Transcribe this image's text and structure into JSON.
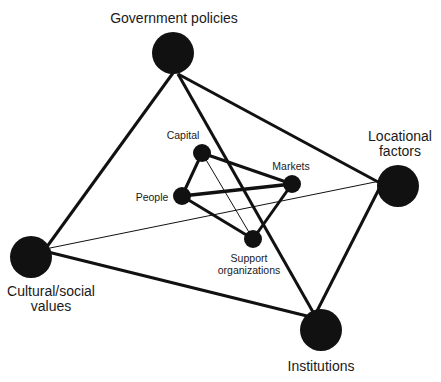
{
  "diagram": {
    "type": "network",
    "colors": {
      "node": "#111111",
      "edge": "#111111",
      "background": "#ffffff",
      "text": "#1a1a1a"
    },
    "outer_nodes": [
      {
        "id": "gov",
        "label_lines": [
          "Government policies"
        ],
        "x": 173,
        "y": 53,
        "r": 21
      },
      {
        "id": "loc",
        "label_lines": [
          "Locational",
          "factors"
        ],
        "x": 398,
        "y": 186,
        "r": 21
      },
      {
        "id": "cul",
        "label_lines": [
          "Cultural/social",
          "values"
        ],
        "x": 31,
        "y": 257,
        "r": 21
      },
      {
        "id": "ins",
        "label_lines": [
          "Institutions"
        ],
        "x": 321,
        "y": 330,
        "r": 21
      }
    ],
    "inner_nodes": [
      {
        "id": "cap",
        "label_lines": [
          "Capital"
        ],
        "x": 202,
        "y": 153,
        "r": 9
      },
      {
        "id": "mkt",
        "label_lines": [
          "Markets"
        ],
        "x": 292,
        "y": 184,
        "r": 9
      },
      {
        "id": "ppl",
        "label_lines": [
          "People"
        ],
        "x": 182,
        "y": 196,
        "r": 9
      },
      {
        "id": "sup",
        "label_lines": [
          "Support",
          "organizations"
        ],
        "x": 253,
        "y": 239,
        "r": 9
      }
    ],
    "edges": [
      {
        "from": "gov",
        "to": "cul",
        "weight": "thick"
      },
      {
        "from": "gov",
        "to": "loc",
        "weight": "thick"
      },
      {
        "from": "gov",
        "to": "ins",
        "weight": "thick"
      },
      {
        "from": "loc",
        "to": "ins",
        "weight": "thick"
      },
      {
        "from": "cul",
        "to": "ins",
        "weight": "thick"
      },
      {
        "from": "cul",
        "to": "loc",
        "weight": "thin"
      },
      {
        "from": "cap",
        "to": "ppl",
        "weight": "thick"
      },
      {
        "from": "cap",
        "to": "mkt",
        "weight": "thick"
      },
      {
        "from": "ppl",
        "to": "mkt",
        "weight": "thick"
      },
      {
        "from": "ppl",
        "to": "sup",
        "weight": "thick"
      },
      {
        "from": "mkt",
        "to": "sup",
        "weight": "thick"
      },
      {
        "from": "cap",
        "to": "sup",
        "weight": "thin"
      }
    ],
    "labels": {
      "gov": [
        "Government policies"
      ],
      "loc": [
        "Locational",
        "factors"
      ],
      "cul": [
        "Cultural/social",
        "values"
      ],
      "ins": [
        "Institutions"
      ],
      "cap": [
        "Capital"
      ],
      "mkt": [
        "Markets"
      ],
      "ppl": [
        "People"
      ],
      "sup": [
        "Support",
        "organizations"
      ]
    }
  }
}
